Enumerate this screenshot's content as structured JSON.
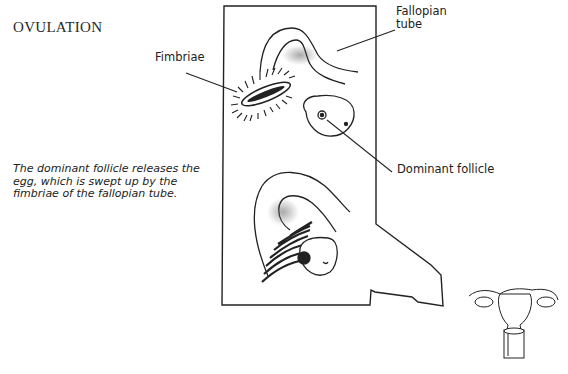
{
  "title": "OVULATION",
  "caption": "The dominant follicle releases the egg, which is swept up by the fimbriae of the fallopian tube.",
  "labels": {
    "fimbriae": "Fimbriae",
    "fallopian_tube_line1": "Fallopian",
    "fallopian_tube_line2": "tube",
    "dominant_follicle": "Dominant follicle"
  },
  "colors": {
    "ink": "#222222",
    "background": "#ffffff"
  }
}
